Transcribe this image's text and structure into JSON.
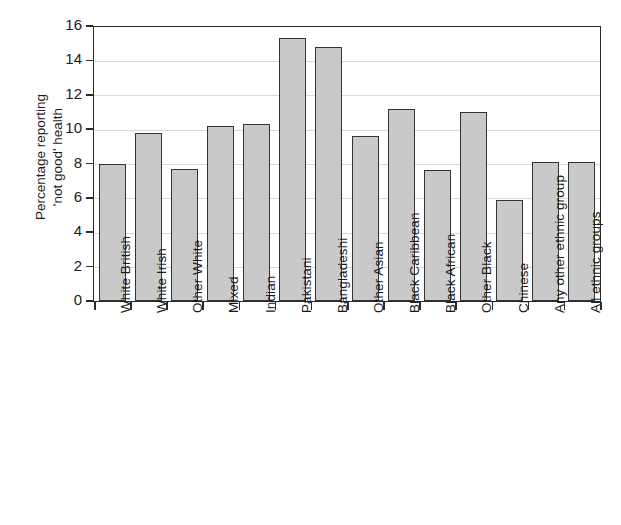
{
  "chart_data": {
    "type": "bar",
    "title": "",
    "xlabel": "",
    "ylabel": "Percentage reporting\n'not good' health",
    "ylim": [
      0,
      16
    ],
    "ytick_step": 2,
    "yticks": [
      "16",
      "14",
      "12",
      "10",
      "8",
      "6",
      "4",
      "2",
      "0"
    ],
    "grid": true,
    "legend": "none",
    "bar_fill_color": "#c9c9c9",
    "bar_border_color": "#333333",
    "gridline_color": "#d9d9d9",
    "axis_color": "#2a2a2a",
    "categories": [
      "White British",
      "White Irish",
      "Other White",
      "Mixed",
      "Indian",
      "Pakistani",
      "Bangladeshi",
      "Other Asian",
      "Black Caribbean",
      "Black African",
      "Other Black",
      "Chinese",
      "Any other ethnic group",
      "All ethnic groups"
    ],
    "values": [
      8.0,
      9.8,
      7.7,
      10.2,
      10.3,
      15.3,
      14.8,
      9.6,
      11.2,
      7.6,
      11.0,
      5.9,
      8.1,
      8.1
    ]
  }
}
